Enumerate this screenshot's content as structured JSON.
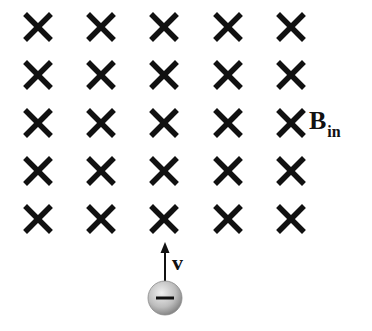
{
  "diagram": {
    "field": {
      "label_main": "B",
      "label_sub": "in",
      "symbol": "cross-into-page",
      "rows": 5,
      "cols": 5,
      "col_x": [
        38,
        101,
        164,
        228,
        291
      ],
      "row_y": [
        27,
        75,
        123,
        171,
        219
      ],
      "color": "#111111"
    },
    "particle": {
      "charge_sign": "−",
      "type": "negative-charge",
      "center": [
        165,
        298
      ],
      "radius": 17,
      "fill_light": "#e6e6e6",
      "fill_dark": "#8a8a8a"
    },
    "velocity": {
      "label": "v",
      "direction": "up"
    }
  }
}
